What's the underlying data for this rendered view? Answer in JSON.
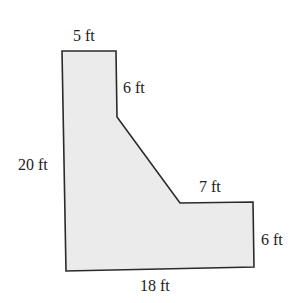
{
  "figure": {
    "shape": "L-shaped polygon with diagonal edge",
    "fill_color": "#ebebeb",
    "stroke_color": "#2a2a2a",
    "labels": {
      "top": "5 ft",
      "upper_right_vertical": "6 ft",
      "left": "20 ft",
      "step_top": "7 ft",
      "right": "6 ft",
      "bottom": "18 ft"
    }
  }
}
